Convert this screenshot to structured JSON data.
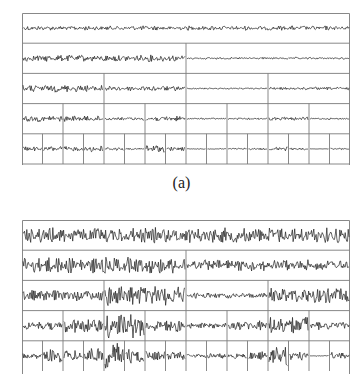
{
  "figure": {
    "type": "wavelet-packet-decomposition-tree",
    "levels": 5,
    "colors": {
      "grid": "#7a7a7a",
      "signal": "#1e1e1e",
      "background": "#ffffff"
    }
  },
  "panel_a": {
    "label": "(a)",
    "row_height": 30.2,
    "closed_bottom": true,
    "amplitudes": [
      [
        1.6
      ],
      [
        2.4,
        0.7
      ],
      [
        2.6,
        1.8,
        0.5,
        1.0
      ],
      [
        2.2,
        2.0,
        1.1,
        1.9,
        0.5,
        0.6,
        1.2,
        0.6
      ],
      [
        1.6,
        1.9,
        1.7,
        2.2,
        1.3,
        0.6,
        2.8,
        1.4,
        0.3,
        0.4,
        0.6,
        0.6,
        1.4,
        0.8,
        0.1,
        0.5
      ]
    ],
    "baseline_offsets": [
      0,
      0,
      0,
      0,
      0
    ]
  },
  "panel_b": {
    "label": "(b)",
    "row_height": 30.2,
    "closed_bottom": false,
    "amplitudes": [
      [
        5.5
      ],
      [
        5.8,
        4.0
      ],
      [
        4.0,
        7.5,
        2.0,
        5.5
      ],
      [
        3.0,
        5.5,
        9.0,
        4.5,
        2.0,
        3.5,
        7.0,
        3.0
      ],
      [
        2.0,
        4.5,
        4.0,
        6.5,
        9.5,
        5.5,
        3.5,
        3.0,
        1.5,
        2.0,
        2.0,
        3.0,
        7.0,
        3.0,
        0.3,
        2.5
      ]
    ]
  }
}
